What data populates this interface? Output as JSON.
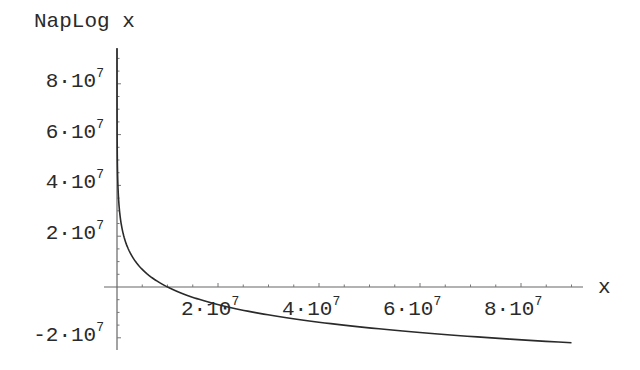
{
  "chart_data": {
    "type": "line",
    "title": "",
    "xlabel": "x",
    "ylabel": "NapLog x",
    "function": "NapLog(x) = 10^7 * ln(10^7 / x)",
    "xlim": [
      0,
      90000000
    ],
    "ylim": [
      -22000000,
      94000000
    ],
    "grid": false,
    "legend": null,
    "x_ticks": [
      {
        "value": 20000000,
        "label_base": "2·10",
        "label_exp": "7"
      },
      {
        "value": 40000000,
        "label_base": "4·10",
        "label_exp": "7"
      },
      {
        "value": 60000000,
        "label_base": "6·10",
        "label_exp": "7"
      },
      {
        "value": 80000000,
        "label_base": "8·10",
        "label_exp": "7"
      }
    ],
    "y_ticks": [
      {
        "value": 80000000,
        "label_base": "8·10",
        "label_exp": "7"
      },
      {
        "value": 60000000,
        "label_base": "6·10",
        "label_exp": "7"
      },
      {
        "value": 40000000,
        "label_base": "4·10",
        "label_exp": "7"
      },
      {
        "value": 20000000,
        "label_base": "2·10",
        "label_exp": "7"
      },
      {
        "value": -20000000,
        "label_base": "-2·10",
        "label_exp": "7"
      }
    ],
    "series": [
      {
        "name": "NapLog x",
        "x": [
          1000,
          100000,
          1000000,
          2000000,
          5000000,
          10000000,
          20000000,
          30000000,
          40000000,
          50000000,
          60000000,
          70000000,
          80000000,
          90000000
        ],
        "y": [
          92103404,
          46051702,
          23025851,
          16094379,
          6931472,
          0,
          -6931472,
          -10986123,
          -13862944,
          -16094379,
          -17917595,
          -19459101,
          -20794415,
          -21972246
        ]
      }
    ],
    "colors": {
      "axis": "#555555",
      "curve": "#2a2a2a",
      "text": "#2a2a2a"
    }
  }
}
